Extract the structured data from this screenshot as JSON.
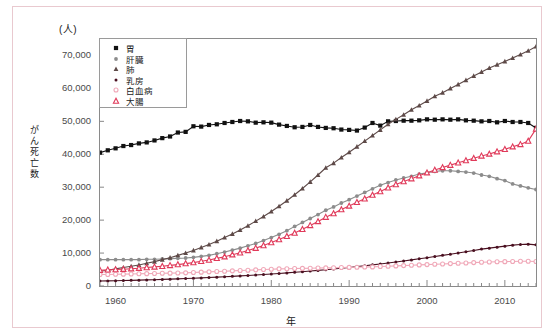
{
  "unit_label": "(人)",
  "y_axis_title": "がん死亡数",
  "x_axis_title": "年",
  "legend": [
    {
      "label": "胃",
      "marker": "filled-square",
      "color": "#111111"
    },
    {
      "label": "肝臓",
      "marker": "filled-circle",
      "color": "#8c8c8c"
    },
    {
      "label": "肺",
      "marker": "filled-triangle",
      "color": "#5e4a48"
    },
    {
      "label": "乳房",
      "marker": "filled-dot",
      "color": "#4a1020"
    },
    {
      "label": "白血病",
      "marker": "open-circle",
      "color": "#f0a8b8"
    },
    {
      "label": "大腸",
      "marker": "open-triangle",
      "color": "#e03a5a"
    }
  ],
  "chart_data": {
    "type": "line",
    "title": "",
    "xlabel": "年",
    "ylabel": "がん死亡数",
    "unit": "(人)",
    "xlim": [
      1958,
      2014
    ],
    "ylim": [
      0,
      75000
    ],
    "yticks": [
      0,
      10000,
      20000,
      30000,
      40000,
      50000,
      60000,
      70000
    ],
    "ytick_labels": [
      "0",
      "10,000",
      "20,000",
      "30,000",
      "40,000",
      "50,000",
      "60,000",
      "70,000"
    ],
    "xticks": [
      1960,
      1970,
      1980,
      1990,
      2000,
      2010
    ],
    "xtick_labels": [
      "1960",
      "1970",
      "1980",
      "1990",
      "2000",
      "2010"
    ],
    "grid": false,
    "legend_position": "top-left",
    "x": [
      1958,
      1959,
      1960,
      1961,
      1962,
      1963,
      1964,
      1965,
      1966,
      1967,
      1968,
      1969,
      1970,
      1971,
      1972,
      1973,
      1974,
      1975,
      1976,
      1977,
      1978,
      1979,
      1980,
      1981,
      1982,
      1983,
      1984,
      1985,
      1986,
      1987,
      1988,
      1989,
      1990,
      1991,
      1992,
      1993,
      1994,
      1995,
      1996,
      1997,
      1998,
      1999,
      2000,
      2001,
      2002,
      2003,
      2004,
      2005,
      2006,
      2007,
      2008,
      2009,
      2010,
      2011,
      2012,
      2013,
      2014
    ],
    "series": [
      {
        "name": "胃",
        "color": "#111111",
        "marker": "filled-square",
        "values": [
          40500,
          41200,
          41800,
          42500,
          42800,
          43300,
          43600,
          44200,
          44900,
          45400,
          46600,
          46800,
          48500,
          48400,
          48900,
          49100,
          49500,
          49800,
          50100,
          50000,
          49600,
          49700,
          49600,
          49000,
          48600,
          48200,
          48300,
          48900,
          48300,
          48000,
          47900,
          47500,
          47400,
          47200,
          48100,
          49500,
          48700,
          50000,
          50100,
          50200,
          50200,
          50300,
          50600,
          50500,
          50600,
          50500,
          50600,
          50300,
          50200,
          50000,
          50100,
          49700,
          50100,
          49800,
          49800,
          49500,
          48000
        ]
      },
      {
        "name": "肝臓",
        "color": "#8c8c8c",
        "marker": "filled-circle",
        "values": [
          8000,
          8000,
          8000,
          8000,
          8000,
          8000,
          8100,
          8100,
          8200,
          8300,
          8400,
          8500,
          8700,
          9000,
          9300,
          9800,
          10300,
          10900,
          11500,
          12200,
          12900,
          13800,
          14700,
          15700,
          16800,
          18100,
          19300,
          20500,
          21700,
          23000,
          24000,
          25200,
          26200,
          27300,
          28400,
          29500,
          30600,
          31400,
          32200,
          32800,
          33300,
          34000,
          34400,
          34800,
          35000,
          35000,
          34800,
          34600,
          34300,
          33700,
          33300,
          32600,
          32000,
          31000,
          30400,
          29800,
          29300
        ]
      },
      {
        "name": "肺",
        "color": "#5e4a48",
        "marker": "filled-triangle",
        "values": [
          4500,
          4800,
          5200,
          5600,
          6000,
          6400,
          6900,
          7400,
          8000,
          8600,
          9300,
          10000,
          10800,
          11700,
          12600,
          13600,
          14700,
          15800,
          17000,
          18300,
          19700,
          21100,
          22600,
          24200,
          25900,
          27700,
          29600,
          31600,
          33700,
          35900,
          37300,
          39000,
          40600,
          42300,
          44000,
          45700,
          47400,
          49100,
          50600,
          52000,
          53500,
          54800,
          56200,
          57600,
          58700,
          60000,
          61200,
          62500,
          63800,
          65000,
          66200,
          67200,
          68200,
          69200,
          70300,
          71400,
          72700
        ]
      },
      {
        "name": "乳房",
        "color": "#4a1020",
        "marker": "filled-dot",
        "values": [
          1500,
          1550,
          1600,
          1650,
          1720,
          1780,
          1850,
          1920,
          2000,
          2080,
          2170,
          2260,
          2360,
          2460,
          2570,
          2680,
          2800,
          2930,
          3060,
          3200,
          3340,
          3490,
          3650,
          3810,
          3980,
          4160,
          4340,
          4540,
          4740,
          4950,
          5170,
          5400,
          5640,
          5890,
          6150,
          6420,
          6700,
          6990,
          7290,
          7600,
          7930,
          8260,
          8600,
          8950,
          9300,
          9660,
          10000,
          10400,
          10800,
          11200,
          11500,
          11800,
          12100,
          12400,
          12600,
          12700,
          12500
        ]
      },
      {
        "name": "白血病",
        "color": "#f0a8b8",
        "marker": "open-circle",
        "values": [
          3500,
          3500,
          3550,
          3600,
          3650,
          3700,
          3750,
          3800,
          3850,
          3900,
          3950,
          4000,
          4100,
          4200,
          4300,
          4400,
          4500,
          4600,
          4700,
          4800,
          4900,
          5000,
          5100,
          5200,
          5250,
          5300,
          5350,
          5400,
          5450,
          5500,
          5550,
          5600,
          5650,
          5700,
          5750,
          5800,
          5900,
          6000,
          6100,
          6200,
          6300,
          6400,
          6500,
          6600,
          6700,
          6800,
          6900,
          7000,
          7100,
          7200,
          7300,
          7350,
          7400,
          7450,
          7500,
          7500,
          7450
        ]
      },
      {
        "name": "大腸",
        "color": "#e03a5a",
        "marker": "open-triangle",
        "values": [
          4800,
          4900,
          5000,
          5100,
          5250,
          5400,
          5600,
          5800,
          6000,
          6250,
          6500,
          6800,
          7100,
          7500,
          7900,
          8400,
          8900,
          9500,
          10100,
          10800,
          11500,
          12300,
          13200,
          14100,
          15100,
          16100,
          17200,
          18400,
          19600,
          20900,
          22000,
          23200,
          24300,
          25400,
          26500,
          27600,
          28700,
          29800,
          30800,
          31700,
          32600,
          33500,
          34400,
          35200,
          36000,
          36700,
          37400,
          38100,
          38800,
          39500,
          40100,
          40800,
          41500,
          42300,
          43000,
          44000,
          47700
        ]
      }
    ]
  }
}
